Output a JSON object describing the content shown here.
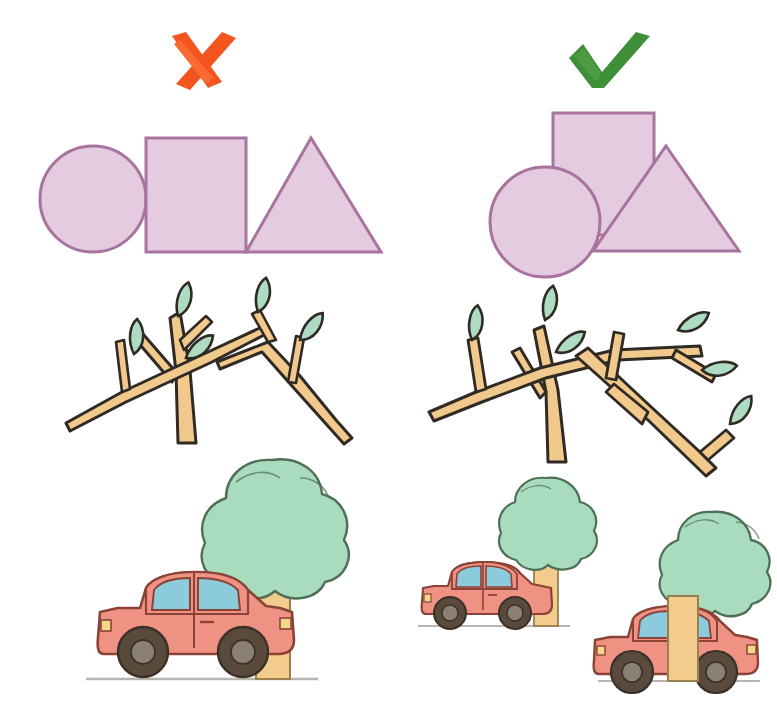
{
  "page": {
    "background_color": "#ffffff",
    "width": 777,
    "height": 725
  },
  "marks": {
    "incorrect": {
      "icon": "cross-mark-icon",
      "label": "✘",
      "color": "#f4551f",
      "cx": 196,
      "cy": 62
    },
    "correct": {
      "icon": "check-mark-icon",
      "label": "✔",
      "color": "#3f8f38",
      "cx": 600,
      "cy": 60
    }
  },
  "palette": {
    "shape_fill": "#e5cbe0",
    "shape_stroke": "#a8739f",
    "wood_fill": "#f2c98c",
    "wood_stroke": "#2f2a24",
    "leaf_fill": "#aedcc2",
    "leaf_stroke": "#2f2a24",
    "foliage_fill": "#a9dcbf",
    "foliage_stroke": "#4f6f56",
    "car_body": "#ef9283",
    "car_stroke": "#8a4336",
    "window_fill": "#8ccbdc",
    "tire_fill": "#5a4a3c",
    "hub_fill": "#8a8076",
    "headlight_fill": "#f2d98a",
    "ground_line": "#b8b4ae",
    "trunk_fill": "#f3cb8d",
    "trunk_stroke": "#9a8050"
  },
  "rows": [
    {
      "name": "shapes-row",
      "left_caption": "circle, square and triangle placed in a flat line, all touching on one baseline",
      "right_caption": "circle, square and triangle overlapping at different depths",
      "shapes": [
        "circle",
        "square",
        "triangle"
      ]
    },
    {
      "name": "branches-row",
      "left_caption": "two leafy branches crossing flatly on the same plane",
      "right_caption": "three leafy branches layered in front of and behind one another",
      "leaf_count_left": 4,
      "leaf_count_right": 6
    },
    {
      "name": "car-tree-row",
      "left_caption": "one car and one tree side by side on a single ground line",
      "right_caption": "two car-and-tree pairs at different distances, near tree trunk overlapping the near car",
      "scenes_left": 1,
      "scenes_right": 2
    }
  ]
}
